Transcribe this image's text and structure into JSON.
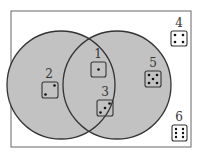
{
  "diagram": {
    "type": "venn",
    "colors": {
      "fill": "#c2c2c2",
      "stroke": "#333333",
      "frame": "#666666",
      "background": "#ffffff"
    },
    "sets": [
      {
        "name": "left-set",
        "members": [
          2,
          1,
          3
        ]
      },
      {
        "name": "right-set",
        "members": [
          1,
          3,
          5
        ]
      }
    ],
    "items": [
      {
        "label": "1",
        "pips": 1,
        "region": "intersection"
      },
      {
        "label": "2",
        "pips": 2,
        "region": "left-only"
      },
      {
        "label": "3",
        "pips": 3,
        "region": "intersection"
      },
      {
        "label": "4",
        "pips": 4,
        "region": "outside"
      },
      {
        "label": "5",
        "pips": 5,
        "region": "right-only"
      },
      {
        "label": "6",
        "pips": 6,
        "region": "outside"
      }
    ]
  }
}
